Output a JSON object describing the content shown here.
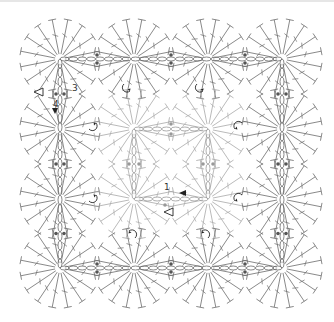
{
  "diagram": {
    "type": "crochet-join-chart",
    "grid": {
      "rows": 4,
      "cols": 4
    },
    "motif": {
      "shape": "circle",
      "stitches_per_round": 16,
      "radius": 40
    },
    "centers_x": [
      60,
      134,
      208,
      282
    ],
    "centers_y": [
      59,
      129,
      199,
      268
    ],
    "colors": {
      "outer_stitch": "#6b6b6b",
      "inner_stitch": "#a8a8a8",
      "chain": "#6b6b6b",
      "inner_chain": "#9a9a9a",
      "dot": "#555555",
      "arrow": "#222222"
    },
    "labels": [
      {
        "text": "3",
        "x": 72,
        "y": 84
      },
      {
        "text": "4",
        "x": 53,
        "y": 100
      },
      {
        "text": "1",
        "x": 164,
        "y": 183
      }
    ],
    "inner_square": {
      "x1": 134,
      "y1": 129,
      "x2": 208,
      "y2": 199
    },
    "turn_arrows": [
      {
        "x": 127,
        "y": 88,
        "dir": "up"
      },
      {
        "x": 200,
        "y": 88,
        "dir": "up"
      },
      {
        "x": 93,
        "y": 126,
        "dir": "left"
      },
      {
        "x": 238,
        "y": 126,
        "dir": "right"
      },
      {
        "x": 93,
        "y": 198,
        "dir": "left"
      },
      {
        "x": 238,
        "y": 198,
        "dir": "right"
      },
      {
        "x": 132,
        "y": 234,
        "dir": "down"
      },
      {
        "x": 205,
        "y": 234,
        "dir": "down"
      }
    ],
    "start_markers": [
      {
        "x": 40,
        "y": 92,
        "type": "open-triangle"
      },
      {
        "x": 170,
        "y": 212,
        "type": "open-triangle"
      }
    ],
    "end_markers": [
      {
        "x": 55,
        "y": 112,
        "type": "filled-triangle-down"
      },
      {
        "x": 182,
        "y": 193,
        "type": "filled-triangle-left"
      }
    ]
  }
}
